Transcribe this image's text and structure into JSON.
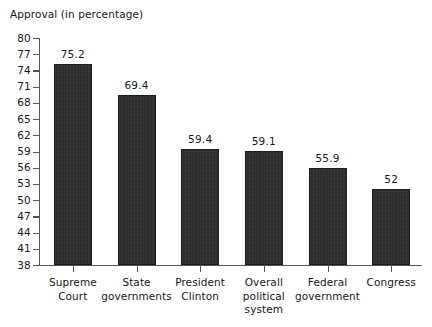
{
  "chart_data": {
    "type": "bar",
    "title": "Approval (in percentage)",
    "xlabel": "",
    "ylabel": "",
    "ylim": [
      38,
      80
    ],
    "ytick_step": 3,
    "yticks": [
      38,
      41,
      44,
      47,
      50,
      53,
      56,
      59,
      62,
      65,
      68,
      71,
      74,
      77,
      80
    ],
    "grid": false,
    "legend": "none",
    "bar_color": "#2b2b2b",
    "axis_color": "#555555",
    "text_color": "#161616",
    "categories": [
      "Supreme Court",
      "State governments",
      "President Clinton",
      "Overall political system",
      "Federal government",
      "Congress"
    ],
    "category_lines": [
      [
        "Supreme",
        "Court"
      ],
      [
        "State",
        "governments"
      ],
      [
        "President",
        "Clinton"
      ],
      [
        "Overall",
        "political",
        "system"
      ],
      [
        "Federal",
        "government"
      ],
      [
        "Congress"
      ]
    ],
    "values": [
      75.2,
      69.4,
      59.4,
      59.1,
      55.9,
      52
    ],
    "value_labels": [
      "75.2",
      "69.4",
      "59.4",
      "59.1",
      "55.9",
      "52"
    ]
  }
}
